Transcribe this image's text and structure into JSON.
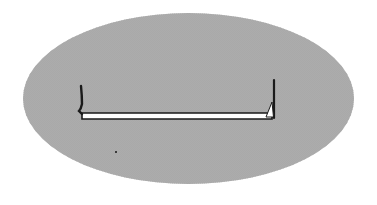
{
  "figure": {
    "shape": "dithered-oval",
    "colors": {
      "background": "#ffffff",
      "blob_dark": "#8a8a8a",
      "blob_light": "#c8c8c8",
      "stroke": "#1a1a1a",
      "bar_fill": "#ffffff"
    },
    "bracket": {
      "left_x": 81,
      "right_x": 274,
      "bar_y": 116,
      "left_top_y": 85,
      "right_top_y": 80
    }
  }
}
